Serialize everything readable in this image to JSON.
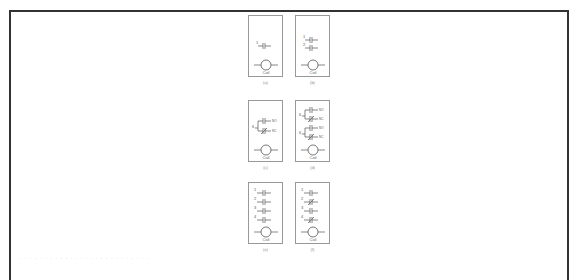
{
  "figure": {
    "panels": [
      {
        "id": "a",
        "caption": "(a)",
        "coil_label": "Coil",
        "contacts": [
          {
            "num": "1",
            "type": "NO"
          }
        ]
      },
      {
        "id": "b",
        "caption": "(b)",
        "coil_label": "Coil",
        "contacts": [
          {
            "num": "1",
            "type": "NO"
          },
          {
            "num": "2",
            "type": "NO"
          }
        ]
      },
      {
        "id": "c",
        "caption": "(c)",
        "coil_label": "Coil",
        "contacts": [
          {
            "num": "6",
            "type": "NO",
            "tag": "NO"
          },
          {
            "num": "",
            "type": "NC",
            "tag": "NC"
          }
        ]
      },
      {
        "id": "d",
        "caption": "(d)",
        "coil_label": "Coil",
        "contacts": [
          {
            "num": "6",
            "type": "NO",
            "tag": "NO"
          },
          {
            "num": "",
            "type": "NC",
            "tag": "NC"
          },
          {
            "num": "6",
            "type": "NO",
            "tag": "NO"
          },
          {
            "num": "",
            "type": "NC",
            "tag": "NC"
          }
        ]
      },
      {
        "id": "e",
        "caption": "(e)",
        "coil_label": "Coil",
        "contacts": [
          {
            "num": "1",
            "type": "NO"
          },
          {
            "num": "2",
            "type": "NO"
          },
          {
            "num": "3",
            "type": "NO"
          },
          {
            "num": "4",
            "type": "NO"
          }
        ]
      },
      {
        "id": "f",
        "caption": "(f)",
        "coil_label": "Coil",
        "contacts": [
          {
            "num": "1",
            "type": "NO"
          },
          {
            "num": "2",
            "type": "NC"
          },
          {
            "num": "3",
            "type": "NO"
          },
          {
            "num": "4",
            "type": "NC"
          }
        ]
      }
    ],
    "bottom_text": "· · ·   · ·   · · · ·   · ·  · · ·    · ·   · · · · ·   · ·  · · ·"
  }
}
